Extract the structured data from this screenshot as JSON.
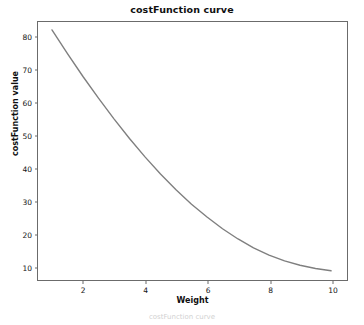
{
  "figure": {
    "width": 364,
    "height": 325,
    "background": "#ffffff",
    "caption_faint": "costFunction curve"
  },
  "chart_data": {
    "type": "line",
    "title": "costFunction curve",
    "xlabel": "Weight",
    "ylabel": "costFunction value",
    "xlim": [
      0.55,
      10.45
    ],
    "ylim": [
      6.4,
      84.4
    ],
    "xticks": [
      2,
      4,
      6,
      8,
      10
    ],
    "yticks": [
      10,
      20,
      30,
      40,
      50,
      60,
      70,
      80
    ],
    "grid": false,
    "legend": null,
    "line_color": "#7f7f7f",
    "line_width": 1.2,
    "series": [
      {
        "name": "costFunction",
        "x": [
          1.0,
          1.5,
          2.0,
          2.5,
          3.0,
          3.5,
          4.0,
          4.5,
          5.0,
          5.5,
          6.0,
          6.5,
          7.0,
          7.5,
          8.0,
          8.5,
          9.0,
          9.5,
          10.0
        ],
        "y": [
          82.0,
          74.8,
          67.8,
          61.2,
          54.9,
          48.9,
          43.3,
          38.1,
          33.3,
          28.9,
          25.0,
          21.4,
          18.3,
          15.6,
          13.4,
          11.6,
          10.3,
          9.3,
          8.6
        ]
      }
    ]
  },
  "axes": {
    "frame_color": "#6b6b6b",
    "tick_color": "#6b6b6b",
    "tick_label_color": "#141414"
  }
}
